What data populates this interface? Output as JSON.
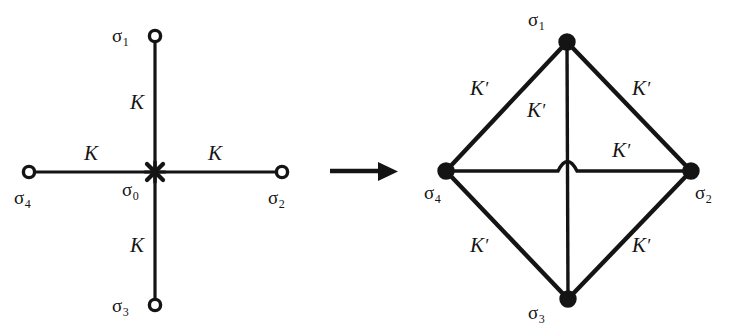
{
  "figure": {
    "background_color": "#ffffff",
    "ink_color": "#141414",
    "caption": "",
    "width": 739,
    "height": 336
  },
  "transform_arrow": {
    "name": "maps-to",
    "symbol": "→",
    "x1": 330,
    "y1": 171,
    "x2": 396,
    "y2": 171
  },
  "left_diagram": {
    "name": "five-spin-cross",
    "center_marker": "cross-x-marker",
    "nodes": [
      {
        "id": "sigma1",
        "label": "σ",
        "sub": "1",
        "x": 155,
        "y": 36,
        "label_x": 112,
        "label_y": 26,
        "style": "open-circle"
      },
      {
        "id": "sigma2",
        "label": "σ",
        "sub": "2",
        "x": 282,
        "y": 172,
        "label_x": 268,
        "label_y": 188,
        "style": "open-circle"
      },
      {
        "id": "sigma3",
        "label": "σ",
        "sub": "3",
        "x": 155,
        "y": 305,
        "label_x": 112,
        "label_y": 296,
        "style": "open-circle"
      },
      {
        "id": "sigma4",
        "label": "σ",
        "sub": "4",
        "x": 29,
        "y": 172,
        "label_x": 14,
        "label_y": 188,
        "style": "open-circle"
      },
      {
        "id": "sigma0",
        "label": "σ",
        "sub": "0",
        "x": 155,
        "y": 172,
        "label_x": 122,
        "label_y": 180,
        "style": "x-marker"
      }
    ],
    "edges": [
      {
        "id": "edge-0-1",
        "from": "sigma0",
        "to": "sigma1",
        "label": "K",
        "prime": "",
        "label_x": 130,
        "label_y": 92
      },
      {
        "id": "edge-0-2",
        "from": "sigma0",
        "to": "sigma2",
        "label": "K",
        "prime": "",
        "label_x": 208,
        "label_y": 143
      },
      {
        "id": "edge-0-3",
        "from": "sigma0",
        "to": "sigma3",
        "label": "K",
        "prime": "",
        "label_x": 130,
        "label_y": 235
      },
      {
        "id": "edge-0-4",
        "from": "sigma0",
        "to": "sigma4",
        "label": "K",
        "prime": "",
        "label_x": 84,
        "label_y": 143
      }
    ]
  },
  "right_diagram": {
    "name": "four-spin-diamond",
    "crossing_hop": "line-hop-bridge",
    "nodes": [
      {
        "id": "sigma1",
        "label": "σ",
        "sub": "1",
        "x": 567,
        "y": 42,
        "label_x": 528,
        "label_y": 10,
        "style": "filled-ring"
      },
      {
        "id": "sigma2",
        "label": "σ",
        "sub": "2",
        "x": 691,
        "y": 171,
        "label_x": 695,
        "label_y": 183,
        "style": "filled-ring"
      },
      {
        "id": "sigma3",
        "label": "σ",
        "sub": "3",
        "x": 568,
        "y": 299,
        "label_x": 528,
        "label_y": 303,
        "style": "filled-ring"
      },
      {
        "id": "sigma4",
        "label": "σ",
        "sub": "4",
        "x": 446,
        "y": 171,
        "label_x": 424,
        "label_y": 183,
        "style": "filled-ring"
      }
    ],
    "edges": [
      {
        "id": "edge-1-4",
        "from": "sigma1",
        "to": "sigma4",
        "label": "K",
        "prime": "′",
        "label_x": 470,
        "label_y": 78
      },
      {
        "id": "edge-1-2",
        "from": "sigma1",
        "to": "sigma2",
        "label": "K",
        "prime": "′",
        "label_x": 632,
        "label_y": 78
      },
      {
        "id": "edge-1-3",
        "from": "sigma1",
        "to": "sigma3",
        "label": "K",
        "prime": "′",
        "label_x": 527,
        "label_y": 100
      },
      {
        "id": "edge-4-2",
        "from": "sigma4",
        "to": "sigma2",
        "label": "K",
        "prime": "′",
        "label_x": 612,
        "label_y": 140
      },
      {
        "id": "edge-4-3",
        "from": "sigma4",
        "to": "sigma3",
        "label": "K",
        "prime": "′",
        "label_x": 470,
        "label_y": 235
      },
      {
        "id": "edge-2-3",
        "from": "sigma2",
        "to": "sigma3",
        "label": "K",
        "prime": "′",
        "label_x": 632,
        "label_y": 235
      }
    ]
  }
}
